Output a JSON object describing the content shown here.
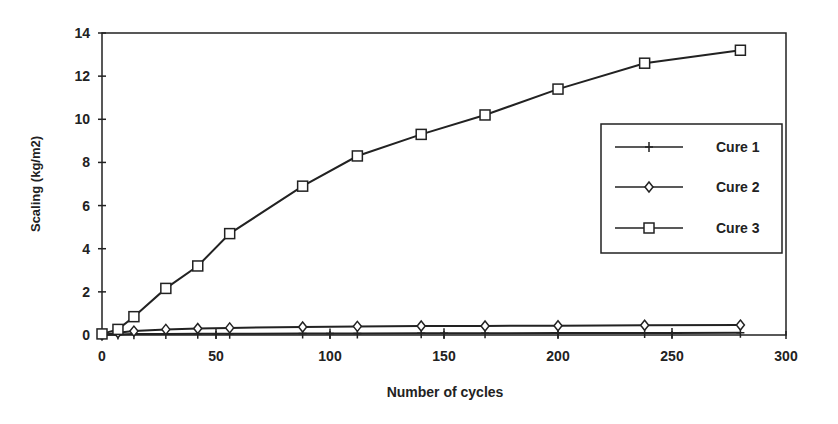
{
  "chart_data": {
    "type": "line",
    "title": "",
    "xlabel": "Number of cycles",
    "ylabel": "Scaling (kg/m2)",
    "xlim": [
      0,
      300
    ],
    "ylim": [
      0,
      14
    ],
    "xticks": [
      0,
      50,
      100,
      150,
      200,
      250,
      300
    ],
    "yticks": [
      0,
      2,
      4,
      6,
      8,
      10,
      12,
      14
    ],
    "grid": false,
    "legend_position": "right, inside plot, mid-height",
    "series": [
      {
        "name": "Cure 1",
        "marker": "plus",
        "x": [
          0,
          7,
          14,
          28,
          42,
          50,
          56,
          88,
          100,
          112,
          140,
          150,
          168,
          200,
          238,
          250,
          280
        ],
        "y": [
          0,
          0.02,
          0.04,
          0.05,
          0.06,
          0.06,
          0.06,
          0.07,
          0.07,
          0.07,
          0.08,
          0.08,
          0.08,
          0.09,
          0.09,
          0.09,
          0.1
        ]
      },
      {
        "name": "Cure 2",
        "marker": "diamond",
        "x": [
          0,
          7,
          14,
          28,
          42,
          56,
          88,
          112,
          140,
          168,
          200,
          238,
          280
        ],
        "y": [
          0,
          0.1,
          0.18,
          0.26,
          0.3,
          0.33,
          0.37,
          0.4,
          0.42,
          0.42,
          0.43,
          0.45,
          0.46
        ]
      },
      {
        "name": "Cure 3",
        "marker": "square",
        "x": [
          0,
          7,
          14,
          28,
          42,
          56,
          88,
          112,
          140,
          168,
          200,
          238,
          280
        ],
        "y": [
          0.05,
          0.26,
          0.85,
          2.16,
          3.2,
          4.7,
          6.9,
          8.3,
          9.3,
          10.2,
          11.4,
          12.6,
          13.2
        ]
      }
    ]
  },
  "legend": {
    "items": [
      {
        "label": "Cure 1",
        "marker": "plus"
      },
      {
        "label": "Cure 2",
        "marker": "diamond"
      },
      {
        "label": "Cure 3",
        "marker": "square"
      }
    ]
  },
  "colors": {
    "line": "#222222",
    "background": "#ffffff"
  }
}
